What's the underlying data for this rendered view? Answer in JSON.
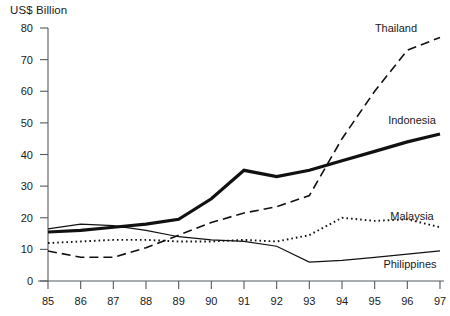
{
  "chart_data": {
    "type": "line",
    "title": "",
    "ylabel": "US$ Billion",
    "xlabel": "",
    "x": [
      "85",
      "86",
      "87",
      "88",
      "89",
      "90",
      "91",
      "92",
      "93",
      "94",
      "95",
      "96",
      "97"
    ],
    "ylim": [
      0,
      80
    ],
    "yticks": [
      0,
      10,
      20,
      30,
      40,
      50,
      60,
      70,
      80
    ],
    "grid": false,
    "legend_position": "inline-right-of-series",
    "series": [
      {
        "name": "Thailand",
        "style": "dashed",
        "color": "#111111",
        "values": [
          9.5,
          7.5,
          7.5,
          10.5,
          14.5,
          18.5,
          21.5,
          23.5,
          27.0,
          45.0,
          60.0,
          73.0,
          77.0
        ]
      },
      {
        "name": "Indonesia",
        "style": "solid-thick",
        "color": "#111111",
        "values": [
          15.5,
          16.0,
          17.0,
          18.0,
          19.5,
          26.0,
          35.0,
          33.0,
          35.0,
          38.0,
          41.0,
          44.0,
          46.5
        ]
      },
      {
        "name": "Malaysia",
        "style": "dotted",
        "color": "#111111",
        "values": [
          12.0,
          12.5,
          13.0,
          13.0,
          12.5,
          12.5,
          13.0,
          12.5,
          14.5,
          20.0,
          19.0,
          19.5,
          17.0
        ]
      },
      {
        "name": "Philippines",
        "style": "solid-thin",
        "color": "#111111",
        "values": [
          16.5,
          18.0,
          17.5,
          16.0,
          14.0,
          13.0,
          12.5,
          11.0,
          6.0,
          6.5,
          7.5,
          8.5,
          9.5
        ]
      }
    ]
  },
  "labels": {
    "thailand": "Thailand",
    "indonesia": "Indonesia",
    "malaysia": "Malaysia",
    "philippines": "Philippines"
  }
}
